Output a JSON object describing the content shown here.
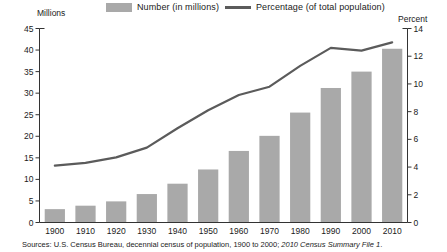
{
  "legend": {
    "number_label": "Number (in millions)",
    "percentage_label": "Percentage (of total population)",
    "bar_color": "#a9a9a9",
    "line_color": "#5b5b5b"
  },
  "axis_titles": {
    "left": "Millions",
    "right": "Percent"
  },
  "source": {
    "prefix": "Sources: U.S. Census Bureau, decennial census of population, 1900 to 2000; ",
    "italic": "2010 Census Summary File 1",
    "suffix": "."
  },
  "chart_data": {
    "type": "bar",
    "title": "",
    "subtitle": "",
    "xlabel": "",
    "ylabel": "Millions",
    "y2label": "Percent",
    "categories": [
      "1900",
      "1910",
      "1920",
      "1930",
      "1940",
      "1950",
      "1960",
      "1970",
      "1980",
      "1990",
      "2000",
      "2010"
    ],
    "ylim": [
      0,
      45
    ],
    "y2lim": [
      0,
      14
    ],
    "yticks": [
      0,
      5,
      10,
      15,
      20,
      25,
      30,
      35,
      40,
      45
    ],
    "y2ticks": [
      0,
      2,
      4,
      6,
      8,
      10,
      12,
      14
    ],
    "grid": false,
    "legend_position": "top",
    "series": [
      {
        "name": "Number (in millions)",
        "type": "bar",
        "axis": "left",
        "color": "#a9a9a9",
        "values": [
          3.1,
          3.9,
          4.9,
          6.6,
          9.0,
          12.3,
          16.6,
          20.1,
          25.5,
          31.2,
          35.0,
          40.3
        ]
      },
      {
        "name": "Percentage (of total population)",
        "type": "line",
        "axis": "right",
        "color": "#5b5b5b",
        "values": [
          4.1,
          4.3,
          4.7,
          5.4,
          6.8,
          8.1,
          9.2,
          9.8,
          11.3,
          12.6,
          12.4,
          13.0
        ]
      }
    ]
  }
}
